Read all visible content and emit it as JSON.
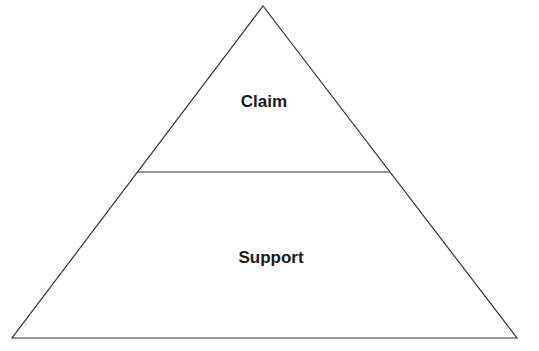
{
  "diagram": {
    "type": "pyramid",
    "levels": [
      {
        "label": "Claim",
        "position": "top"
      },
      {
        "label": "Support",
        "position": "bottom"
      }
    ],
    "colors": {
      "stroke": "#333333",
      "fill": "#ffffff",
      "text": "#1a1a1a"
    }
  }
}
